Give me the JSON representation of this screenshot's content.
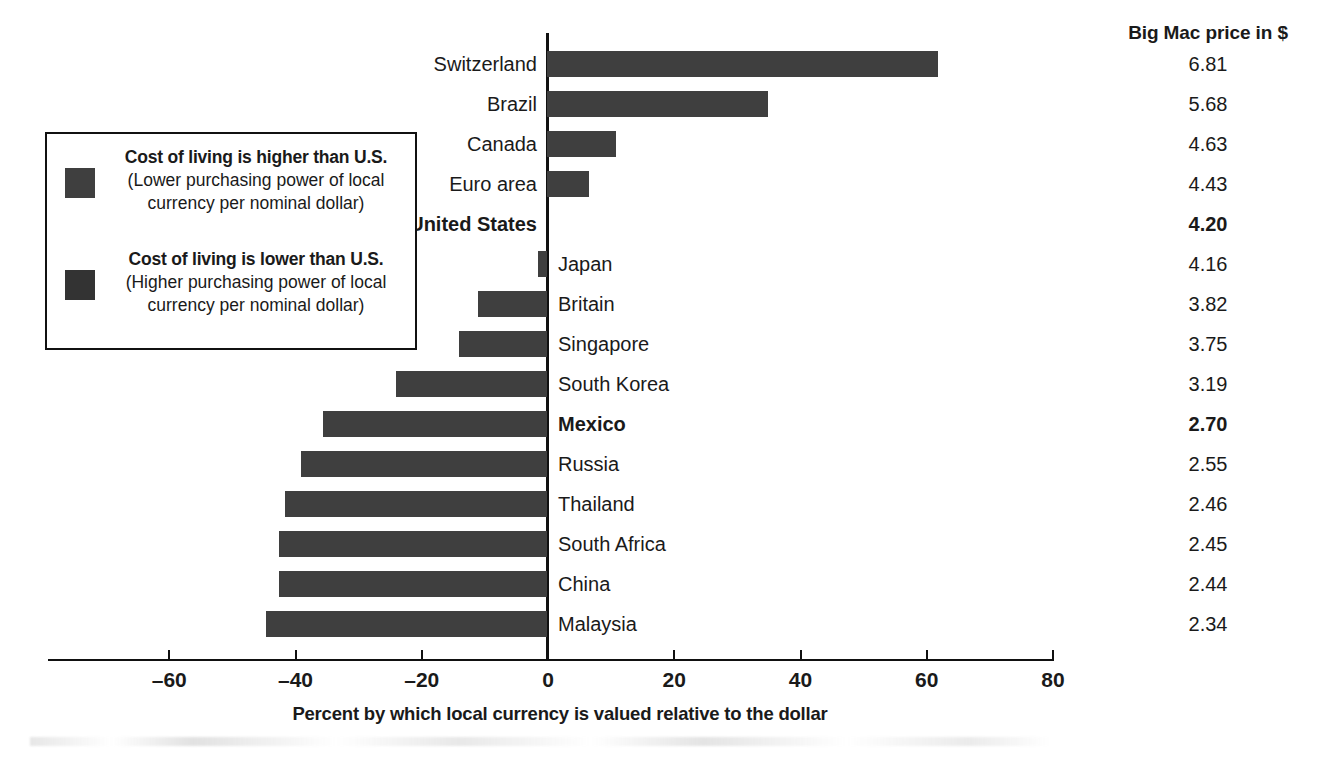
{
  "chart_data": {
    "type": "bar",
    "orientation": "horizontal",
    "title": "",
    "xlabel": "Percent by which local currency is valued relative to the dollar",
    "ylabel": "",
    "xlim": [
      -63,
      80
    ],
    "xticks": [
      -60,
      -40,
      -20,
      0,
      20,
      40,
      60,
      80
    ],
    "xtick_labels": [
      "–60",
      "–40",
      "–20",
      "0",
      "20",
      "40",
      "60",
      "80"
    ],
    "grid": false,
    "legend_position": "left-inside",
    "bar_color": "#3f3f3f",
    "categories": [
      "Switzerland",
      "Brazil",
      "Canada",
      "Euro area",
      "United States",
      "Japan",
      "Britain",
      "Singapore",
      "South Korea",
      "Mexico",
      "Russia",
      "Thailand",
      "South Africa",
      "China",
      "Malaysia"
    ],
    "values": [
      62,
      35,
      11,
      6.6,
      0,
      -1.4,
      -11,
      -14,
      -24,
      -35.5,
      -39,
      -41.5,
      -42.5,
      -42.5,
      -44.5
    ],
    "extra_column": {
      "header": "Big Mac price in $",
      "values": [
        "6.81",
        "5.68",
        "4.63",
        "4.43",
        "4.20",
        "4.16",
        "3.82",
        "3.75",
        "3.19",
        "2.70",
        "2.55",
        "2.46",
        "2.45",
        "2.44",
        "2.34"
      ]
    }
  },
  "price_column": {
    "header": "Big Mac price in $"
  },
  "axis": {
    "title": "Percent by which local currency is valued relative to the dollar",
    "ticks": [
      {
        "label": "–60",
        "value": -60
      },
      {
        "label": "–40",
        "value": -40
      },
      {
        "label": "–20",
        "value": -20
      },
      {
        "label": "0",
        "value": 0
      },
      {
        "label": "20",
        "value": 20
      },
      {
        "label": "40",
        "value": 40
      },
      {
        "label": "60",
        "value": 60
      },
      {
        "label": "80",
        "value": 80
      }
    ]
  },
  "legend": {
    "entries": [
      {
        "swatch_color": "#3f3f3f",
        "title": "Cost of living is higher than U.S.",
        "sub_line1": "(Lower purchasing power of local",
        "sub_line2": "currency per nominal dollar)"
      },
      {
        "swatch_color": "#333333",
        "title": "Cost of living is lower than U.S.",
        "sub_line1": "(Higher purchasing power of local",
        "sub_line2": "currency per nominal dollar)"
      }
    ]
  },
  "rows": [
    {
      "country": "Switzerland",
      "value": 62,
      "price": "6.81",
      "bold": false,
      "label_side": "left"
    },
    {
      "country": "Brazil",
      "value": 35,
      "price": "5.68",
      "bold": false,
      "label_side": "left"
    },
    {
      "country": "Canada",
      "value": 11,
      "price": "4.63",
      "bold": false,
      "label_side": "left"
    },
    {
      "country": "Euro area",
      "value": 6.6,
      "price": "4.43",
      "bold": false,
      "label_side": "left"
    },
    {
      "country": "United States",
      "value": 0,
      "price": "4.20",
      "bold": true,
      "label_side": "left"
    },
    {
      "country": "Japan",
      "value": -1.4,
      "price": "4.16",
      "bold": false,
      "label_side": "right"
    },
    {
      "country": "Britain",
      "value": -11,
      "price": "3.82",
      "bold": false,
      "label_side": "right"
    },
    {
      "country": "Singapore",
      "value": -14,
      "price": "3.75",
      "bold": false,
      "label_side": "right"
    },
    {
      "country": "South Korea",
      "value": -24,
      "price": "3.19",
      "bold": false,
      "label_side": "right"
    },
    {
      "country": "Mexico",
      "value": -35.5,
      "price": "2.70",
      "bold": true,
      "label_side": "right"
    },
    {
      "country": "Russia",
      "value": -39,
      "price": "2.55",
      "bold": false,
      "label_side": "right"
    },
    {
      "country": "Thailand",
      "value": -41.5,
      "price": "2.46",
      "bold": false,
      "label_side": "right"
    },
    {
      "country": "South Africa",
      "value": -42.5,
      "price": "2.45",
      "bold": false,
      "label_side": "right"
    },
    {
      "country": "China",
      "value": -42.5,
      "price": "2.44",
      "bold": false,
      "label_side": "right"
    },
    {
      "country": "Malaysia",
      "value": -44.5,
      "price": "2.34",
      "bold": false,
      "label_side": "right"
    }
  ]
}
